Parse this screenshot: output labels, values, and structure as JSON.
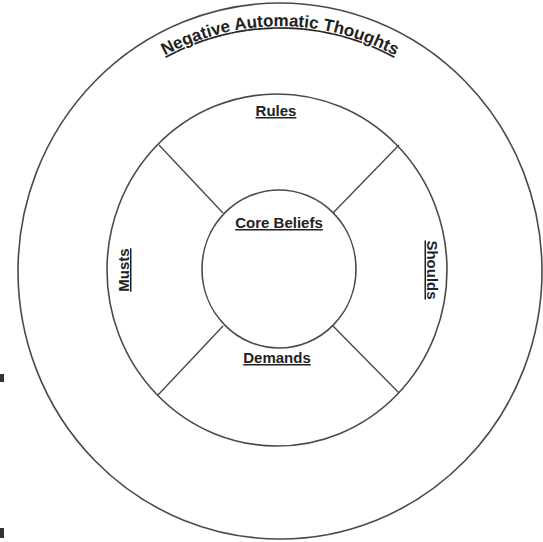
{
  "diagram": {
    "outer_ring": {
      "label": "Negative Automatic Thoughts"
    },
    "middle_ring": {
      "labels": {
        "top": "Rules",
        "left": "Musts",
        "right": "Shoulds",
        "bottom": "Demands"
      }
    },
    "inner_circle": {
      "label": "Core Beliefs"
    },
    "colors": {
      "stroke": "#4a4a4a",
      "text": "#222222",
      "background": "#ffffff"
    }
  }
}
